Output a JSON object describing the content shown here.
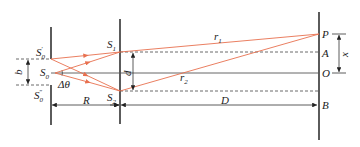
{
  "diagram": {
    "type": "double-slit interference geometry",
    "labels": {
      "s0_prime": {
        "main": "S",
        "sub": "0",
        "sup": "′"
      },
      "s0": {
        "main": "S",
        "sub": "0"
      },
      "s0_double_prime": {
        "main": "S",
        "sub": "0",
        "sup": "″"
      },
      "s1": {
        "main": "S",
        "sub": "1"
      },
      "s2": {
        "main": "S",
        "sub": "2"
      },
      "r1": {
        "main": "r",
        "sub": "1"
      },
      "r2": {
        "main": "r",
        "sub": "2"
      },
      "b": "b",
      "d": "d",
      "delta_theta": "Δθ",
      "R": "R",
      "D": "D",
      "P": "P",
      "A": "A",
      "O": "O",
      "B": "B",
      "x": "x"
    },
    "colors": {
      "ray": "#e8704f",
      "line": "#333333",
      "text": "#222222"
    }
  }
}
